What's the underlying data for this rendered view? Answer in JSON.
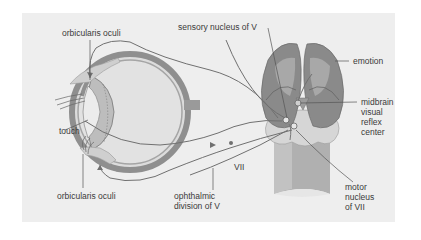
{
  "figure": {
    "colors": {
      "panel_background": "#eeeeee",
      "page_background": "#ffffff",
      "hemisphere": "#8a8a8a",
      "hemisphere_highlight": "#a9a9a9",
      "brainstem": "#b5b5b5",
      "pons": "#d4d4d4",
      "eye_wall": "#8f8f8f",
      "nerve_line": "#707070",
      "label_text": "#3a3a3a"
    },
    "labels": {
      "orbicularis_top": "orbicularis oculi",
      "sensory_nucleus": "sensory nucleus of V",
      "emotion": "emotion",
      "midbrain_line1": "midbrain",
      "midbrain_line2": "visual",
      "midbrain_line3": "reflex",
      "midbrain_line4": "center",
      "touch": "touch",
      "seven": "VII",
      "orbicularis_bottom": "orbicularis oculi",
      "ophthalmic_line1": "ophthalmic",
      "ophthalmic_line2": "division of V",
      "motor_line1": "motor",
      "motor_line2": "nucleus",
      "motor_line3": "of VII"
    }
  }
}
